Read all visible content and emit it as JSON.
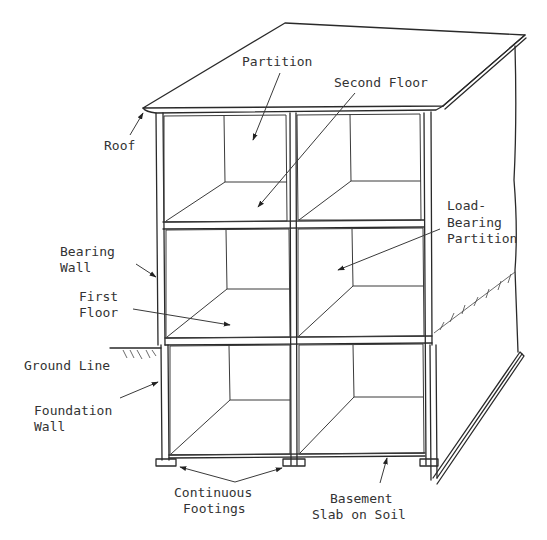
{
  "diagram": {
    "colors": {
      "line": "#2a2a2a",
      "text": "#333333",
      "background": "#ffffff"
    },
    "labels": {
      "partition": "Partition",
      "second_floor": "Second Floor",
      "roof": "Roof",
      "load_bearing_1": "Load-",
      "load_bearing_2": "Bearing",
      "load_bearing_3": "Partition",
      "bearing_wall_1": "Bearing",
      "bearing_wall_2": "Wall",
      "first_floor_1": "First",
      "first_floor_2": "Floor",
      "ground_line": "Ground Line",
      "foundation_wall_1": "Foundation",
      "foundation_wall_2": "Wall",
      "continuous_footings_1": "Continuous",
      "continuous_footings_2": "Footings",
      "basement_slab_1": "Basement",
      "basement_slab_2": "Slab on Soil"
    }
  }
}
